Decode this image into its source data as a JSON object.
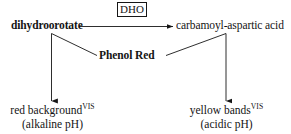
{
  "diagram": {
    "stroke_color": "#161616",
    "background_color": "#ffffff",
    "reactant": {
      "label": "dihydroorotate"
    },
    "product": {
      "label": "carbamoyl-aspartic acid"
    },
    "enzyme": {
      "label": "DHO"
    },
    "indicator": {
      "label": "Phenol Red"
    },
    "outcomes": {
      "left": {
        "main": "red background",
        "superscript": "VIS",
        "condition": "(alkaline pH)"
      },
      "right": {
        "main": "yellow bands",
        "superscript": "VIS",
        "condition": "(acidic pH)"
      }
    }
  }
}
